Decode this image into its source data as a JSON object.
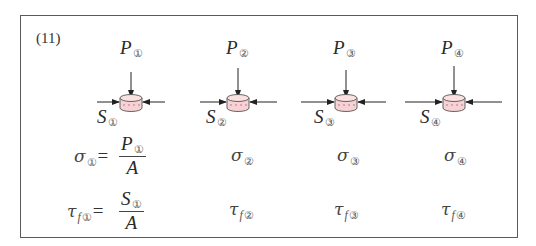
{
  "figure": {
    "problem_number": "(11)",
    "colors": {
      "border": "#5a5a5a",
      "cylinder_fill": "#f6d2d4",
      "cylinder_stroke": "#555555",
      "text": "#2a2a2a"
    },
    "columns": [
      {
        "id": "1",
        "load_label": "P",
        "load_sub": "①",
        "shear_label": "S",
        "shear_sub": "①",
        "stress_symbol": "σ",
        "stress_sub": "①",
        "shear_stress_symbol": "τ",
        "shear_stress_f": "f",
        "shear_stress_sub": "①"
      },
      {
        "id": "2",
        "load_label": "P",
        "load_sub": "②",
        "shear_label": "S",
        "shear_sub": "②",
        "stress_symbol": "σ",
        "stress_sub": "②",
        "shear_stress_symbol": "τ",
        "shear_stress_f": "f",
        "shear_stress_sub": "②"
      },
      {
        "id": "3",
        "load_label": "P",
        "load_sub": "③",
        "shear_label": "S",
        "shear_sub": "③",
        "stress_symbol": "σ",
        "stress_sub": "③",
        "shear_stress_symbol": "τ",
        "shear_stress_f": "f",
        "shear_stress_sub": "③"
      },
      {
        "id": "4",
        "load_label": "P",
        "load_sub": "④",
        "shear_label": "S",
        "shear_sub": "④",
        "stress_symbol": "σ",
        "stress_sub": "④",
        "shear_stress_symbol": "τ",
        "shear_stress_f": "f",
        "shear_stress_sub": "④"
      }
    ],
    "formulas": {
      "stress": {
        "equals": "=",
        "numerator": "P",
        "numerator_sub": "①",
        "denominator": "A"
      },
      "shear_stress": {
        "equals": "=",
        "numerator": "S",
        "numerator_sub": "①",
        "denominator": "A"
      }
    }
  }
}
